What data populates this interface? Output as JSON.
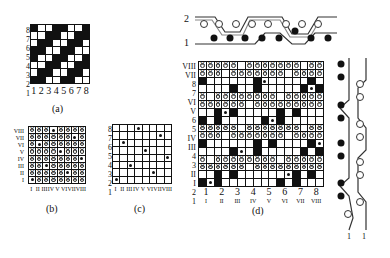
{
  "figure_a": {
    "caption": "(a)",
    "row_labels": [
      "8",
      "7",
      "6",
      "5",
      "4",
      "3",
      "2",
      "1"
    ],
    "col_labels": [
      "1",
      "2",
      "3",
      "4",
      "5",
      "6",
      "7",
      "8"
    ],
    "cells": [
      "bwwbbwwb",
      "wwbbwwbb",
      "wbbwwbbw",
      "bbwwbbww",
      "bwwbbwwb",
      "wwbbwwbb",
      "wbbwwbbw",
      "bbwwbbww"
    ]
  },
  "figure_b": {
    "caption": "(b)",
    "row_labels": [
      "VIII",
      "VII",
      "VI",
      "V",
      "IV",
      "III",
      "II",
      "I"
    ],
    "col_labels": [
      "I",
      "II",
      "III",
      "IV",
      "V",
      "VI",
      "VII",
      "VIII"
    ],
    "cells": [
      "xxxdxxxx",
      "xxxxxxdx",
      "xdxxxxxx",
      "xxxxdxxx",
      "xxxxxxxd",
      "xxdxxxxx",
      "xxxxxdxx",
      "dxxxxxxx"
    ]
  },
  "figure_c": {
    "caption": "(c)",
    "row_labels": [
      "8",
      "7",
      "6",
      "5",
      "4",
      "3",
      "2",
      "1"
    ],
    "col_labels": [
      "I",
      "II",
      "III",
      "IV",
      "V",
      "VI",
      "VII",
      "VIII"
    ],
    "cells": [
      "wwwdwwww",
      "wwwwwwdw",
      "wdwwwwww",
      "wwwwdwww",
      "wwwwwwwd",
      "wwdwwwww",
      "wwwwwdww",
      "dwwwwwww"
    ]
  },
  "figure_d": {
    "caption": "(d)",
    "row_labels": [
      "VIII",
      "VII",
      "8",
      "7",
      "VI",
      "V",
      "6",
      "5",
      "IV",
      "III",
      "4",
      "3",
      "II",
      "I",
      "2",
      "1"
    ],
    "col_labels_arabic": [
      "1",
      "2",
      "3",
      "4",
      "5",
      "6",
      "7",
      "8"
    ],
    "col_labels_roman": [
      "I",
      "II",
      "III",
      "IV",
      "V",
      "VI",
      "VII",
      "VIII"
    ],
    "cells": [
      "xxxxxwxxxxxxxwxx",
      "xxxwxxxxxxxwxxxx",
      "bwwwwwwbdwwwwwbw",
      "wwwwbwwbwwwwwbdb",
      "xwxxxxxxxxwxxxxx",
      "xxxxxxwxxxxxxxxx",
      "wwbdbwwwwwbwbwww",
      "bwbwwwwwbdbwwwww",
      "xxxxxwxxxxxxxwxx",
      "xxxwxxxxxxxwxxxx",
      "bwwwwwwbwbwwwwbd",
      "wwwwbdwbwwwwwbwb",
      "xwxxxxxxxxwxxxxx",
      "xxxxxxwxxxxxxxxx",
      "wwbwbwwwwwwdbwbw",
      "bdbwwwwwwwbwbwww"
    ],
    "cross_section_top": {
      "labels": [
        "2",
        "1"
      ]
    },
    "cross_section_right": {
      "labels": [
        "1",
        "1"
      ]
    }
  }
}
